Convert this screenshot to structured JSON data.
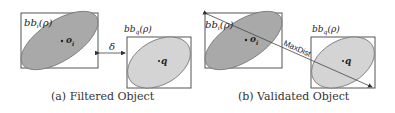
{
  "subfigures": [
    {
      "id": "a",
      "caption": "(a) Filtered Object",
      "object_box_label": "bbᵢ(ρ)",
      "object_point_label": "oᵢ",
      "query_box_label": "bb_q(ρ)",
      "query_point_label": "q",
      "gap_label": "δ"
    },
    {
      "id": "b",
      "caption": "(b) Validated Object",
      "object_box_label": "bbᵢ(ρ)",
      "object_point_label": "oᵢ",
      "query_box_label": "bb_q(ρ)",
      "query_point_label": "q",
      "distance_label": "MaxDist"
    }
  ],
  "colors": {
    "object_fill": "#a9a9a9",
    "query_fill": "#d4d4d4",
    "stroke": "#555555"
  }
}
